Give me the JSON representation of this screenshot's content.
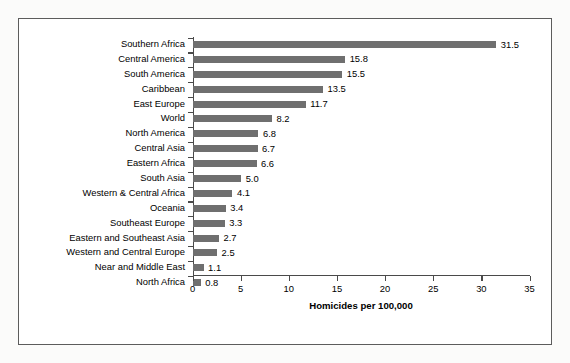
{
  "chart_data": {
    "type": "bar",
    "orientation": "horizontal",
    "title": "",
    "xlabel": "Homicides per 100,000",
    "ylabel": "",
    "xlim": [
      0,
      35
    ],
    "xticks": [
      0,
      5,
      10,
      15,
      20,
      25,
      30,
      35
    ],
    "grid": false,
    "legend": null,
    "bar_color": "#6f6f6f",
    "categories": [
      "Southern Africa",
      "Central America",
      "South America",
      "Caribbean",
      "East Europe",
      "World",
      "North America",
      "Central Asia",
      "Eastern Africa",
      "South Asia",
      "Western & Central Africa",
      "Oceania",
      "Southeast Europe",
      "Eastern and Southeast Asia",
      "Western and Central Europe",
      "Near and Middle East",
      "North Africa"
    ],
    "values": [
      31.5,
      15.8,
      15.5,
      13.5,
      11.7,
      8.2,
      6.8,
      6.7,
      6.6,
      5.0,
      4.1,
      3.4,
      3.3,
      2.7,
      2.5,
      1.1,
      0.8
    ],
    "value_labels": [
      "31.5",
      "15.8",
      "15.5",
      "13.5",
      "11.7",
      "8.2",
      "6.8",
      "6.7",
      "6.6",
      "5.0",
      "4.1",
      "3.4",
      "3.3",
      "2.7",
      "2.5",
      "1.1",
      "0.8"
    ]
  }
}
